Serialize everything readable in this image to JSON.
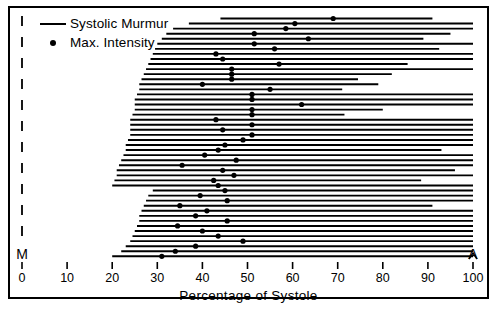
{
  "figure": {
    "xlabel": "Percentage of Systole",
    "left_marker": "M",
    "right_marker": "A"
  },
  "legend": {
    "items": [
      {
        "symbol": "line",
        "label": "Systolic Murmur"
      },
      {
        "symbol": "dot",
        "label": "Max. Intensity"
      }
    ]
  },
  "chart_data": {
    "type": "bar",
    "title": "",
    "subtitle": "",
    "xlabel": "Percentage of Systole",
    "ylabel": "",
    "xlim": [
      0,
      100
    ],
    "ylim": [
      0,
      47
    ],
    "grid": false,
    "legend_position": "top-left",
    "axis_annotations": {
      "x_left_marker": "M",
      "x_right_marker": "A"
    },
    "xticks": [
      0,
      10,
      20,
      30,
      40,
      50,
      60,
      70,
      80,
      90,
      100
    ],
    "xtick_labels": [
      "0",
      "10",
      "20",
      "30",
      "40",
      "50",
      "60",
      "70",
      "80",
      "90",
      "100"
    ],
    "series": [
      {
        "name": "Systolic Murmur",
        "symbol": "line"
      },
      {
        "name": "Max. Intensity",
        "symbol": "dot"
      }
    ],
    "records": [
      {
        "start": 44,
        "end": 91,
        "max_intensity": 69
      },
      {
        "start": 37,
        "end": 100,
        "max_intensity": 60.5
      },
      {
        "start": 33.5,
        "end": 100,
        "max_intensity": 58.5
      },
      {
        "start": 32,
        "end": 95,
        "max_intensity": 51.5
      },
      {
        "start": 31,
        "end": 89,
        "max_intensity": 63.5
      },
      {
        "start": 30,
        "end": 100,
        "max_intensity": 51.5
      },
      {
        "start": 29.5,
        "end": 92.5,
        "max_intensity": 56
      },
      {
        "start": 29,
        "end": 100,
        "max_intensity": 43
      },
      {
        "start": 28.5,
        "end": 100,
        "max_intensity": 44.5
      },
      {
        "start": 28,
        "end": 85.5,
        "max_intensity": 57
      },
      {
        "start": 27.5,
        "end": 100,
        "max_intensity": 46.5
      },
      {
        "start": 27,
        "end": 82,
        "max_intensity": 46.5
      },
      {
        "start": 26.5,
        "end": 74.5,
        "max_intensity": 46.5
      },
      {
        "start": 26,
        "end": 79,
        "max_intensity": 40
      },
      {
        "start": 26,
        "end": 71,
        "max_intensity": 55
      },
      {
        "start": 25.5,
        "end": 100,
        "max_intensity": 51
      },
      {
        "start": 25,
        "end": 100,
        "max_intensity": 51
      },
      {
        "start": 25,
        "end": 100,
        "max_intensity": 62
      },
      {
        "start": 25,
        "end": 80,
        "max_intensity": 51
      },
      {
        "start": 24.5,
        "end": 71.5,
        "max_intensity": 51
      },
      {
        "start": 24,
        "end": 100,
        "max_intensity": 43
      },
      {
        "start": 24,
        "end": 100,
        "max_intensity": 51
      },
      {
        "start": 24,
        "end": 100,
        "max_intensity": 44.5
      },
      {
        "start": 24,
        "end": 100,
        "max_intensity": 51
      },
      {
        "start": 23.5,
        "end": 100,
        "max_intensity": 49
      },
      {
        "start": 23,
        "end": 100,
        "max_intensity": 45
      },
      {
        "start": 23,
        "end": 93,
        "max_intensity": 43.5
      },
      {
        "start": 22.5,
        "end": 100,
        "max_intensity": 40.5
      },
      {
        "start": 22,
        "end": 100,
        "max_intensity": 47.5
      },
      {
        "start": 21.5,
        "end": 100,
        "max_intensity": 35.5
      },
      {
        "start": 21,
        "end": 96,
        "max_intensity": 44.5
      },
      {
        "start": 21,
        "end": 100,
        "max_intensity": 47
      },
      {
        "start": 20.5,
        "end": 88.5,
        "max_intensity": 42.5
      },
      {
        "start": 20,
        "end": 100,
        "max_intensity": 43.5
      },
      {
        "start": 29,
        "end": 100,
        "max_intensity": 45
      },
      {
        "start": 28,
        "end": 100,
        "max_intensity": 39.5
      },
      {
        "start": 27.5,
        "end": 100,
        "max_intensity": 45.5
      },
      {
        "start": 27,
        "end": 91,
        "max_intensity": 35
      },
      {
        "start": 26.5,
        "end": 100,
        "max_intensity": 41
      },
      {
        "start": 26,
        "end": 100,
        "max_intensity": 38.5
      },
      {
        "start": 26,
        "end": 100,
        "max_intensity": 45.5
      },
      {
        "start": 25.5,
        "end": 100,
        "max_intensity": 34.5
      },
      {
        "start": 25,
        "end": 100,
        "max_intensity": 40
      },
      {
        "start": 24.5,
        "end": 100,
        "max_intensity": 43.5
      },
      {
        "start": 24,
        "end": 100,
        "max_intensity": 49
      },
      {
        "start": 23,
        "end": 100,
        "max_intensity": 38.5
      },
      {
        "start": 22,
        "end": 100,
        "max_intensity": 34
      },
      {
        "start": 20,
        "end": 100,
        "max_intensity": 31
      }
    ]
  }
}
